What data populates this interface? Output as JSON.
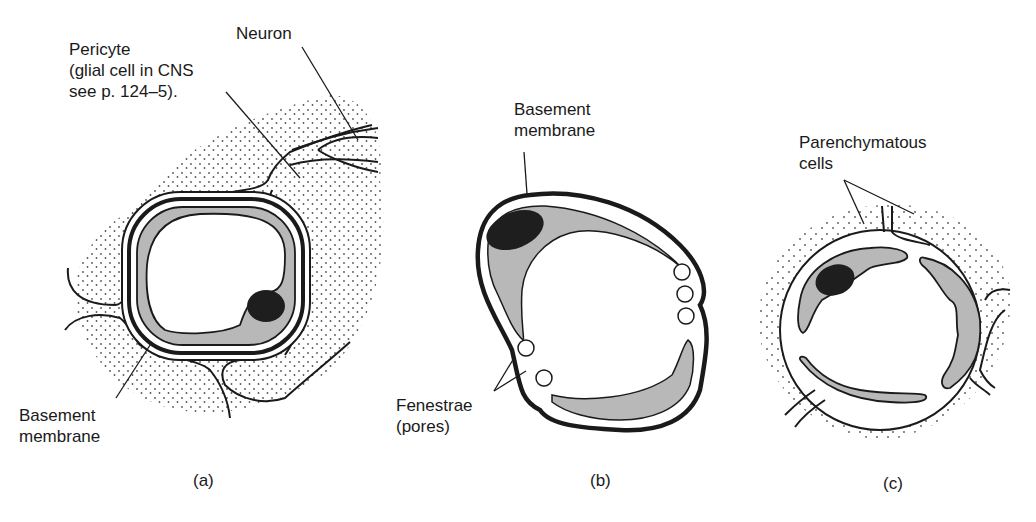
{
  "figure": {
    "panels": [
      {
        "id": "a",
        "caption": "(a)",
        "labels": {
          "pericyte_line1": "Pericyte",
          "pericyte_line2": "(glial cell in CNS",
          "pericyte_line3": "see p. 124–5).",
          "neuron": "Neuron",
          "basement_line1": "Basement",
          "basement_line2": "membrane"
        }
      },
      {
        "id": "b",
        "caption": "(b)",
        "labels": {
          "basement_line1": "Basement",
          "basement_line2": "membrane",
          "fenestrae_line1": "Fenestrae",
          "fenestrae_line2": "(pores)"
        }
      },
      {
        "id": "c",
        "caption": "(c)",
        "labels": {
          "parenchymatous_line1": "Parenchymatous",
          "parenchymatous_line2": "cells"
        }
      }
    ],
    "colors": {
      "stroke": "#1a1a1a",
      "cytoplasm_fill": "#b8b8b8",
      "nucleus_fill": "#1e1e1e",
      "stipple": "#555555",
      "background": "#ffffff"
    }
  }
}
